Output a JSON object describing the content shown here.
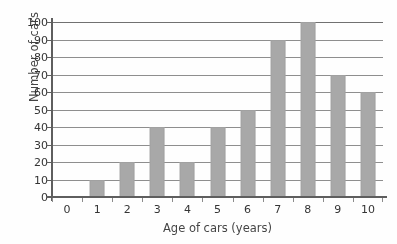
{
  "chart_data": {
    "type": "bar",
    "title": "",
    "xlabel": "Age of cars (years)",
    "ylabel": "Number of cars",
    "categories": [
      "0",
      "1",
      "2",
      "3",
      "4",
      "5",
      "6",
      "7",
      "8",
      "9",
      "10"
    ],
    "values": [
      0,
      10,
      20,
      40,
      20,
      40,
      50,
      90,
      100,
      70,
      60
    ],
    "ylim": [
      0,
      100
    ],
    "ytick_labels": [
      "0",
      "10",
      "20",
      "30",
      "40",
      "50",
      "60",
      "70",
      "80",
      "90",
      "100"
    ],
    "ytick_values": [
      0,
      10,
      20,
      30,
      40,
      50,
      60,
      70,
      80,
      90,
      100
    ],
    "xlim": [
      0,
      10
    ],
    "grid": true,
    "grid_axis": "y",
    "legend": false,
    "bar_color": "#a9a9a9",
    "axis_color": "#5a5a5a",
    "grid_color": "#8e8e8e",
    "text_color": "#2e2e2e",
    "background": "#fefefe"
  }
}
